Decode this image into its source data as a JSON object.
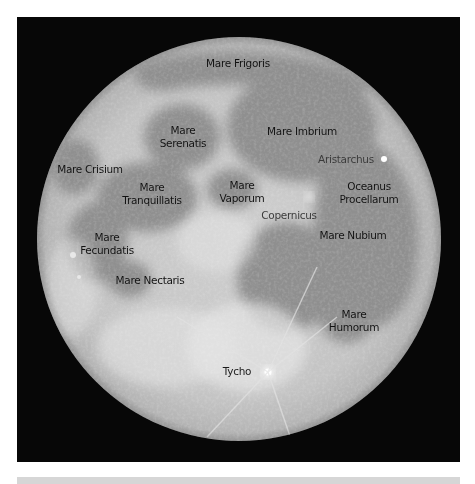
{
  "image": {
    "subject": "Full Moon with labeled maria and craters",
    "background_color": "#070707",
    "moon_highland_color": "#c6c6c6",
    "moon_mare_color": "#8f8f8f",
    "label_color": "#111111",
    "crater_label_color": "#3a3a3a",
    "bottom_bar_color": "#d6d6d6"
  },
  "labels": [
    {
      "id": "mare-frigoris",
      "lines": [
        "Mare Frigoris"
      ],
      "type": "mare"
    },
    {
      "id": "mare-serenatis",
      "lines": [
        "Mare",
        "Serenatis"
      ],
      "type": "mare"
    },
    {
      "id": "mare-imbrium",
      "lines": [
        "Mare Imbrium"
      ],
      "type": "mare"
    },
    {
      "id": "aristarchus",
      "lines": [
        "Aristarchus"
      ],
      "type": "crater"
    },
    {
      "id": "mare-crisium",
      "lines": [
        "Mare Crisium"
      ],
      "type": "mare"
    },
    {
      "id": "mare-tranquillatis",
      "lines": [
        "Mare",
        "Tranquillatis"
      ],
      "type": "mare"
    },
    {
      "id": "mare-vaporum",
      "lines": [
        "Mare",
        "Vaporum"
      ],
      "type": "mare"
    },
    {
      "id": "oceanus-procellarum",
      "lines": [
        "Oceanus",
        "Procellarum"
      ],
      "type": "mare"
    },
    {
      "id": "copernicus",
      "lines": [
        "Copernicus"
      ],
      "type": "crater"
    },
    {
      "id": "mare-nubium",
      "lines": [
        "Mare Nubium"
      ],
      "type": "mare"
    },
    {
      "id": "mare-fecundatis",
      "lines": [
        "Mare",
        "Fecundatis"
      ],
      "type": "mare"
    },
    {
      "id": "mare-nectaris",
      "lines": [
        "Mare Nectaris"
      ],
      "type": "mare"
    },
    {
      "id": "mare-humorum",
      "lines": [
        "Mare",
        "Humorum"
      ],
      "type": "mare"
    },
    {
      "id": "tycho",
      "lines": [
        "Tycho"
      ],
      "type": "crater"
    }
  ]
}
